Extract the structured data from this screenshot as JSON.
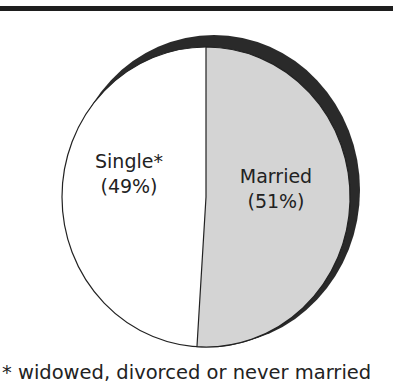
{
  "chart_data": {
    "type": "pie",
    "title": "",
    "slices": [
      {
        "label": "Married",
        "value": 51,
        "display": "(51%)",
        "color": "#d4d4d4"
      },
      {
        "label": "Single*",
        "value": 49,
        "display": "(49%)",
        "color": "#ffffff"
      }
    ],
    "shadow_color": "#2a2a2a",
    "footnote": "* widowed, divorced or never married",
    "legend": "none"
  },
  "labels": {
    "single_name": "Single*",
    "single_pct": "(49%)",
    "married_name": "Married",
    "married_pct": "(51%)"
  },
  "footnote": "* widowed, divorced or never married"
}
